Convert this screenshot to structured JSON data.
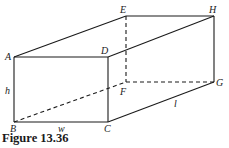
{
  "figure": {
    "caption": "Figure 13.36",
    "shape": "rectangular box (cuboid)",
    "vertices": {
      "A": "A",
      "B": "B",
      "C": "C",
      "D": "D",
      "E": "E",
      "F": "F",
      "G": "G",
      "H": "H"
    },
    "dimensions": {
      "height": "h",
      "width": "w",
      "length": "l"
    },
    "edges": {
      "visible": [
        [
          "A",
          "B"
        ],
        [
          "B",
          "C"
        ],
        [
          "C",
          "D"
        ],
        [
          "D",
          "A"
        ],
        [
          "A",
          "E"
        ],
        [
          "E",
          "H"
        ],
        [
          "D",
          "H"
        ],
        [
          "H",
          "G"
        ],
        [
          "C",
          "G"
        ]
      ],
      "hidden": [
        [
          "E",
          "F"
        ],
        [
          "F",
          "G"
        ],
        [
          "B",
          "F"
        ]
      ]
    }
  }
}
